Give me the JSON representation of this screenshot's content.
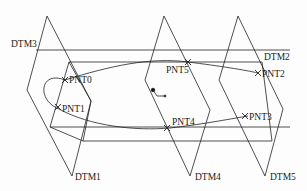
{
  "diagram": {
    "type": "datum-planes-and-points",
    "line_color": "#222222",
    "background": "#fdfdfd",
    "datum_planes": [
      {
        "id": "DTM1",
        "label": "DTM1"
      },
      {
        "id": "DTM2",
        "label": "DTM2"
      },
      {
        "id": "DTM3",
        "label": "DTM3"
      },
      {
        "id": "DTM4",
        "label": "DTM4"
      },
      {
        "id": "DTM5",
        "label": "DTM5"
      }
    ],
    "datum_points": [
      {
        "id": "PNT0",
        "label": "PNT0"
      },
      {
        "id": "PNT1",
        "label": "PNT1"
      },
      {
        "id": "PNT2",
        "label": "PNT2"
      },
      {
        "id": "PNT3",
        "label": "PNT3"
      },
      {
        "id": "PNT4",
        "label": "PNT4"
      },
      {
        "id": "PNT5",
        "label": "PNT5"
      }
    ]
  }
}
